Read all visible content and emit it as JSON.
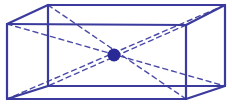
{
  "figure": {
    "canvas": {
      "width": 232,
      "height": 111,
      "background": "#ffffff"
    },
    "colors": {
      "edge": "#3b3b9e",
      "diagonal": "#4a4aa8",
      "center_point": "#2a2a96"
    },
    "stroke": {
      "edge_width": 2.2,
      "diagonal_width": 1.4,
      "diagonal_dash": "5,4"
    },
    "vertices": {
      "front_top_left": {
        "x": 7,
        "y": 24
      },
      "front_top_right": {
        "x": 186,
        "y": 25
      },
      "front_bottom_left": {
        "x": 7,
        "y": 99
      },
      "front_bottom_right": {
        "x": 186,
        "y": 99
      },
      "back_top_left": {
        "x": 48,
        "y": 5
      },
      "back_top_right": {
        "x": 225,
        "y": 5
      },
      "back_bottom_left": {
        "x": 48,
        "y": 86
      },
      "back_bottom_right": {
        "x": 225,
        "y": 86
      }
    },
    "edges": [
      {
        "name": "front-top-edge",
        "from": "front_top_left",
        "to": "front_top_right"
      },
      {
        "name": "front-right-edge",
        "from": "front_top_right",
        "to": "front_bottom_right"
      },
      {
        "name": "front-bottom-edge",
        "from": "front_bottom_right",
        "to": "front_bottom_left"
      },
      {
        "name": "front-left-edge",
        "from": "front_bottom_left",
        "to": "front_top_left"
      },
      {
        "name": "back-top-edge",
        "from": "back_top_left",
        "to": "back_top_right"
      },
      {
        "name": "back-right-edge",
        "from": "back_top_right",
        "to": "back_bottom_right"
      },
      {
        "name": "back-bottom-edge",
        "from": "back_bottom_right",
        "to": "back_bottom_left"
      },
      {
        "name": "back-left-edge",
        "from": "back_bottom_left",
        "to": "back_top_left"
      },
      {
        "name": "connect-top-left-edge",
        "from": "front_top_left",
        "to": "back_top_left"
      },
      {
        "name": "connect-top-right-edge",
        "from": "front_top_right",
        "to": "back_top_right"
      },
      {
        "name": "connect-bottom-left-edge",
        "from": "front_bottom_left",
        "to": "back_bottom_left"
      },
      {
        "name": "connect-bottom-right-edge",
        "from": "front_bottom_right",
        "to": "back_bottom_right"
      }
    ],
    "center_point": {
      "name": "center-point",
      "x": 114,
      "y": 55,
      "radius": 6.5
    },
    "diagonals": [
      {
        "name": "space-diagonal-1",
        "from": "back_top_left",
        "to": "front_bottom_right"
      },
      {
        "name": "space-diagonal-2",
        "from": "front_top_left",
        "to": "back_bottom_right"
      },
      {
        "name": "space-diagonal-3",
        "from": "back_top_right",
        "to": "front_bottom_left"
      },
      {
        "name": "space-diagonal-4",
        "from": "front_top_right",
        "to": "back_bottom_left"
      }
    ]
  }
}
